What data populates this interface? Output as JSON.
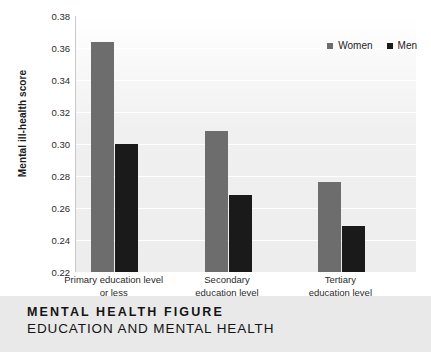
{
  "caption": {
    "title": "MENTAL HEALTH FIGURE",
    "subtitle": "EDUCATION AND MENTAL HEALTH"
  },
  "chart_data": {
    "type": "bar",
    "title": "",
    "xlabel": "",
    "ylabel": "Mental ill-health score",
    "ylim": [
      0.22,
      0.38
    ],
    "ytick_step": 0.02,
    "yticks": [
      "0.38",
      "0.36",
      "0.34",
      "0.32",
      "0.30",
      "0.28",
      "0.26",
      "0.24",
      "0.22"
    ],
    "ytick_values": [
      0.38,
      0.36,
      0.34,
      0.32,
      0.3,
      0.28,
      0.26,
      0.24,
      0.22
    ],
    "grid": true,
    "legend_position": "top-right",
    "categories": [
      "Primary education level or less",
      "Secondary education level",
      "Tertiary education level"
    ],
    "category_lines": [
      [
        "Primary education level",
        "or less"
      ],
      [
        "Secondary",
        "education level"
      ],
      [
        "Tertiary",
        "education level"
      ]
    ],
    "series": [
      {
        "name": "Women",
        "color": "#6d6d6d",
        "values": [
          0.364,
          0.308,
          0.276
        ]
      },
      {
        "name": "Men",
        "color": "#1a1a1a",
        "values": [
          0.3,
          0.268,
          0.249
        ]
      }
    ]
  },
  "colors": {
    "women": "#6d6d6d",
    "men": "#1a1a1a",
    "plot_background": "#f0f0f0",
    "caption_background": "#e9e9e9"
  }
}
